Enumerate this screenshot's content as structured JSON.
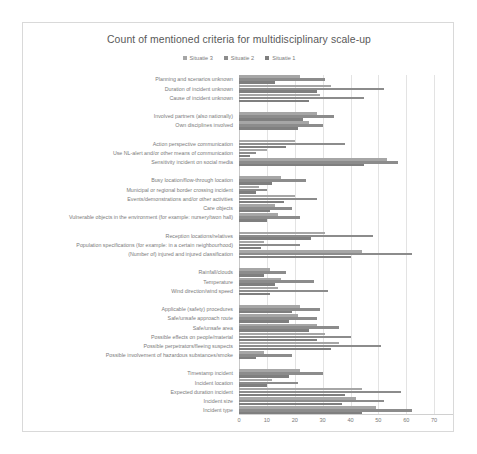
{
  "chart_data": {
    "type": "bar",
    "orientation": "horizontal",
    "title": "Count of mentioned criteria for multidisciplinary scale-up",
    "xlabel": "",
    "ylabel": "",
    "xlim": [
      0,
      80
    ],
    "xticks": [
      0,
      10,
      20,
      30,
      40,
      50,
      60,
      70,
      80
    ],
    "grid": true,
    "legend_position": "top-center",
    "legend": [
      "Situatie 3",
      "Situatie 2",
      "Situatie 1"
    ],
    "series": [
      {
        "name": "Situatie 3",
        "color": "#a6a6a6",
        "values": [
          22,
          33,
          29,
          0,
          28,
          0,
          20,
          10,
          53,
          0,
          15,
          7,
          20,
          13,
          0,
          31,
          9,
          44,
          0,
          11,
          15,
          0,
          14,
          22,
          0,
          21,
          28,
          31,
          36,
          9,
          22,
          0,
          12,
          44,
          42,
          49,
          44
        ]
      },
      {
        "name": "Situatie 2",
        "color": "#8c8c8c",
        "values": [
          31,
          52,
          45,
          0,
          34,
          0,
          38,
          6,
          57,
          0,
          24,
          10,
          28,
          19,
          0,
          48,
          22,
          62,
          0,
          17,
          27,
          0,
          20,
          29,
          0,
          28,
          36,
          40,
          51,
          19,
          30,
          0,
          21,
          58,
          52,
          62,
          52
        ]
      },
      {
        "name": "Situatie 1",
        "color": "#7f7f7f",
        "values": [
          13,
          28,
          25,
          0,
          23,
          0,
          17,
          4,
          45,
          0,
          12,
          6,
          16,
          11,
          0,
          26,
          8,
          40,
          0,
          9,
          13,
          0,
          11,
          19,
          0,
          18,
          25,
          28,
          33,
          6,
          18,
          0,
          10,
          38,
          37,
          44,
          40
        ]
      }
    ],
    "categories": [
      "Planning and scenarios unknown",
      "Duration of incident unknown",
      "Cause of incident unknown",
      "",
      "Involved partners (also nationally)",
      "Own disciplines involved",
      "",
      "Action perspective communication",
      "Use NL-alert and/or other means of communication",
      "Sensitivity incident on social media",
      "",
      "Busy location/flow-through location",
      "Municipal or regional border crossing incident",
      "Events/demonstrations and/or other activities",
      "Care objects",
      "Vulnerable objects in the environment (for example: nursery/twon hall)",
      "",
      "Reception locations/relatives",
      "Population specifications (for example: in a certain neighbourhood)",
      "(Number of) injured and injured classification",
      "",
      "Rainfall/clouds",
      "Temperature",
      "Wind direction/wind speed",
      "",
      "Applicable (safety) procedures",
      "Safe/unsafe approach route",
      "Safe/unsafe area",
      "Possible effects on people/material",
      "Possible perpetrators/fleeing suspects",
      "Possible involvement of hazardous substances/smoke",
      "",
      "Timestamp incident",
      "Incident location",
      "Expected duration incident",
      "Incident size",
      "Incident type"
    ],
    "rows": [
      {
        "label": "Planning and scenarios unknown",
        "s3": 22,
        "s2": 31,
        "s1": 13
      },
      {
        "label": "Duration of incident unknown",
        "s3": 33,
        "s2": 52,
        "s1": 28
      },
      {
        "label": "Cause of incident unknown",
        "s3": 29,
        "s2": 45,
        "s1": 25
      },
      {
        "label": "",
        "s3": 0,
        "s2": 0,
        "s1": 0
      },
      {
        "label": "Involved partners (also nationally)",
        "s3": 28,
        "s2": 34,
        "s1": 23
      },
      {
        "label": "Own disciplines involved",
        "s3": 25,
        "s2": 30,
        "s1": 21
      },
      {
        "label": "",
        "s3": 0,
        "s2": 0,
        "s1": 0
      },
      {
        "label": "Action perspective communication",
        "s3": 20,
        "s2": 38,
        "s1": 17
      },
      {
        "label": "Use NL-alert and/or other means of communication",
        "s3": 10,
        "s2": 6,
        "s1": 4
      },
      {
        "label": "Sensitivity incident on social media",
        "s3": 53,
        "s2": 57,
        "s1": 45
      },
      {
        "label": "",
        "s3": 0,
        "s2": 0,
        "s1": 0
      },
      {
        "label": "Busy location/flow-through location",
        "s3": 15,
        "s2": 24,
        "s1": 12
      },
      {
        "label": "Municipal or regional border crossing incident",
        "s3": 7,
        "s2": 10,
        "s1": 6
      },
      {
        "label": "Events/demonstrations and/or other activities",
        "s3": 20,
        "s2": 28,
        "s1": 16
      },
      {
        "label": "Care objects",
        "s3": 13,
        "s2": 19,
        "s1": 11
      },
      {
        "label": "Vulnerable objects in the environment (for example: nursery/twon hall)",
        "s3": 14,
        "s2": 22,
        "s1": 10
      },
      {
        "label": "",
        "s3": 0,
        "s2": 0,
        "s1": 0
      },
      {
        "label": "Reception locations/relatives",
        "s3": 31,
        "s2": 48,
        "s1": 26
      },
      {
        "label": "Population specifications (for example: in a certain neighbourhood)",
        "s3": 9,
        "s2": 22,
        "s1": 8
      },
      {
        "label": "(Number of) injured and injured classification",
        "s3": 44,
        "s2": 62,
        "s1": 40
      },
      {
        "label": "",
        "s3": 0,
        "s2": 0,
        "s1": 0
      },
      {
        "label": "Rainfall/clouds",
        "s3": 11,
        "s2": 17,
        "s1": 9
      },
      {
        "label": "Temperature",
        "s3": 15,
        "s2": 27,
        "s1": 13
      },
      {
        "label": "Wind direction/wind speed",
        "s3": 14,
        "s2": 32,
        "s1": 11
      },
      {
        "label": "",
        "s3": 0,
        "s2": 0,
        "s1": 0
      },
      {
        "label": "Applicable (safety) procedures",
        "s3": 22,
        "s2": 29,
        "s1": 19
      },
      {
        "label": "Safe/unsafe approach route",
        "s3": 21,
        "s2": 28,
        "s1": 18
      },
      {
        "label": "Safe/unsafe area",
        "s3": 28,
        "s2": 36,
        "s1": 25
      },
      {
        "label": "Possible effects on people/material",
        "s3": 31,
        "s2": 40,
        "s1": 28
      },
      {
        "label": "Possible perpetrators/fleeing suspects",
        "s3": 36,
        "s2": 51,
        "s1": 33
      },
      {
        "label": "Possible involvement of hazardous substances/smoke",
        "s3": 9,
        "s2": 19,
        "s1": 6
      },
      {
        "label": "",
        "s3": 0,
        "s2": 0,
        "s1": 0
      },
      {
        "label": "Timestamp incident",
        "s3": 22,
        "s2": 30,
        "s1": 18
      },
      {
        "label": "Incident location",
        "s3": 12,
        "s2": 21,
        "s1": 10
      },
      {
        "label": "Expected duration incident",
        "s3": 44,
        "s2": 58,
        "s1": 38
      },
      {
        "label": "Incident size",
        "s3": 42,
        "s2": 52,
        "s1": 37
      },
      {
        "label": "Incident type",
        "s3": 49,
        "s2": 62,
        "s1": 44
      }
    ]
  }
}
